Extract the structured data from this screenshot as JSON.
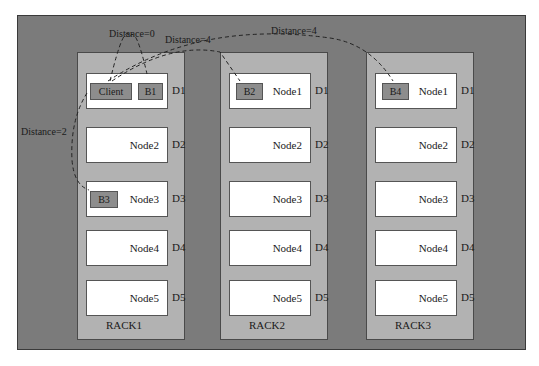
{
  "diagram": {
    "racks": [
      {
        "label": "RACK1",
        "nodes": [
          "Client",
          "Node2",
          "Node3",
          "Node4",
          "Node5"
        ],
        "disks": [
          "D1",
          "D2",
          "D3",
          "D4",
          "D5"
        ]
      },
      {
        "label": "RACK2",
        "nodes": [
          "Node1",
          "Node2",
          "Node3",
          "Node4",
          "Node5"
        ],
        "disks": [
          "D1",
          "D2",
          "D3",
          "D4",
          "D5"
        ]
      },
      {
        "label": "RACK3",
        "nodes": [
          "Node1",
          "Node2",
          "Node3",
          "Node4",
          "Node5"
        ],
        "disks": [
          "D1",
          "D2",
          "D3",
          "D4",
          "D5"
        ]
      }
    ],
    "blocks": {
      "client": "Client",
      "b1": "B1",
      "b2": "B2",
      "b3": "B3",
      "b4": "B4"
    },
    "distances": {
      "client_b1": "Distance=0",
      "client_b2": "Distance=4",
      "client_b4": "Distance=4",
      "client_b3": "Distance=2"
    },
    "colors": {
      "outer_background": "#7b7b7b",
      "rack_background": "#b2b2b2",
      "node_background": "#ffffff",
      "block_background": "#8d8d8d"
    }
  }
}
